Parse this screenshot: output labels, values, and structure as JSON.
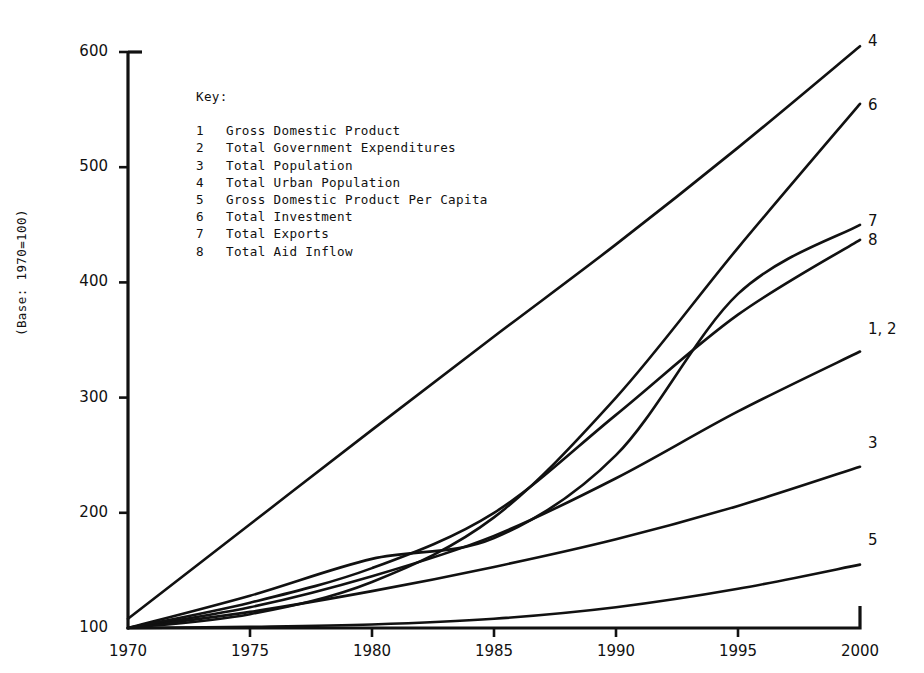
{
  "chart_data": {
    "type": "line",
    "title": "",
    "subtitle": "",
    "xlabel": "",
    "ylabel": "(Base: 1970=100)",
    "xlim": [
      1970,
      2000
    ],
    "ylim": [
      100,
      600
    ],
    "grid": false,
    "legend_position": "inside-upper-left",
    "xticks": [
      "1970",
      "1975",
      "1980",
      "1985",
      "1990",
      "1995",
      "2000"
    ],
    "yticks": [
      "100",
      "200",
      "300",
      "400",
      "500",
      "600"
    ],
    "x": [
      1970,
      1975,
      1980,
      1985,
      1990,
      1995,
      2000
    ],
    "series": [
      {
        "name": "Gross Domestic Product",
        "key": "1",
        "end_label": "1, 2",
        "values": [
          100,
          118,
          145,
          180,
          230,
          288,
          340
        ]
      },
      {
        "name": "Total Government Expenditures",
        "key": "2",
        "end_label": "1, 2",
        "values": [
          100,
          118,
          145,
          180,
          230,
          288,
          340
        ]
      },
      {
        "name": "Total Population",
        "key": "3",
        "end_label": "3",
        "values": [
          100,
          114,
          132,
          153,
          177,
          206,
          240
        ]
      },
      {
        "name": "Total Urban Population",
        "key": "4",
        "end_label": "4",
        "values": [
          108,
          190,
          272,
          353,
          433,
          517,
          605
        ]
      },
      {
        "name": "Gross Domestic Product Per Capita",
        "key": "5",
        "end_label": "5",
        "values": [
          100,
          101,
          103,
          108,
          118,
          134,
          155
        ]
      },
      {
        "name": "Total Investment",
        "key": "6",
        "end_label": "6",
        "values": [
          100,
          112,
          140,
          196,
          300,
          430,
          555
        ]
      },
      {
        "name": "Total Exports",
        "key": "7",
        "end_label": "7",
        "values": [
          100,
          128,
          160,
          178,
          250,
          390,
          450
        ]
      },
      {
        "name": "Total Aid Inflow",
        "key": "8",
        "end_label": "8",
        "values": [
          100,
          122,
          152,
          200,
          285,
          372,
          437
        ]
      }
    ]
  },
  "key": {
    "title": "Key:",
    "entries": [
      {
        "num": "1",
        "label": "Gross Domestic Product"
      },
      {
        "num": "2",
        "label": "Total Government Expenditures"
      },
      {
        "num": "3",
        "label": "Total Population"
      },
      {
        "num": "4",
        "label": "Total Urban Population"
      },
      {
        "num": "5",
        "label": "Gross Domestic Product Per Capita"
      },
      {
        "num": "6",
        "label": "Total Investment"
      },
      {
        "num": "7",
        "label": "Total Exports"
      },
      {
        "num": "8",
        "label": "Total Aid Inflow"
      }
    ]
  },
  "axes": {
    "y_axis_title": "(Base: 1970=100)",
    "y_ticks": [
      "600",
      "500",
      "400",
      "300",
      "200",
      "100"
    ],
    "x_ticks": [
      "1970",
      "1975",
      "1980",
      "1985",
      "1990",
      "1995",
      "2000"
    ]
  },
  "end_labels": [
    {
      "text": "4",
      "x": 868,
      "y": 32
    },
    {
      "text": "6",
      "x": 868,
      "y": 96
    },
    {
      "text": "7",
      "x": 868,
      "y": 212
    },
    {
      "text": "8",
      "x": 868,
      "y": 231
    },
    {
      "text": "1, 2",
      "x": 868,
      "y": 320
    },
    {
      "text": "3",
      "x": 868,
      "y": 434
    },
    {
      "text": "5",
      "x": 868,
      "y": 531
    }
  ],
  "colors": {
    "ink": "#111111",
    "paper": "#ffffff"
  }
}
